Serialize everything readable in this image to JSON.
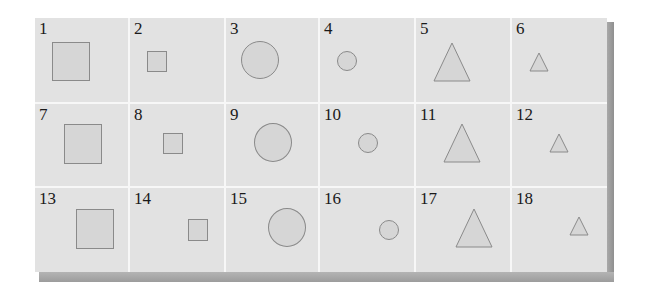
{
  "figure": {
    "rows": 3,
    "columns": 6,
    "background_color": "#e2e2e2",
    "shape_fill": "#d6d6d6",
    "shape_stroke": "#8a8a8a",
    "cells": [
      {
        "number": "1",
        "shape": "square",
        "size": "large"
      },
      {
        "number": "2",
        "shape": "square",
        "size": "small"
      },
      {
        "number": "3",
        "shape": "circle",
        "size": "large"
      },
      {
        "number": "4",
        "shape": "circle",
        "size": "small"
      },
      {
        "number": "5",
        "shape": "triangle",
        "size": "large"
      },
      {
        "number": "6",
        "shape": "triangle",
        "size": "small"
      },
      {
        "number": "7",
        "shape": "square",
        "size": "large"
      },
      {
        "number": "8",
        "shape": "square",
        "size": "small"
      },
      {
        "number": "9",
        "shape": "circle",
        "size": "large"
      },
      {
        "number": "10",
        "shape": "circle",
        "size": "small"
      },
      {
        "number": "11",
        "shape": "triangle",
        "size": "large"
      },
      {
        "number": "12",
        "shape": "triangle",
        "size": "small"
      },
      {
        "number": "13",
        "shape": "square",
        "size": "large"
      },
      {
        "number": "14",
        "shape": "square",
        "size": "small"
      },
      {
        "number": "15",
        "shape": "circle",
        "size": "large"
      },
      {
        "number": "16",
        "shape": "circle",
        "size": "small"
      },
      {
        "number": "17",
        "shape": "triangle",
        "size": "large"
      },
      {
        "number": "18",
        "shape": "triangle",
        "size": "small"
      }
    ]
  }
}
